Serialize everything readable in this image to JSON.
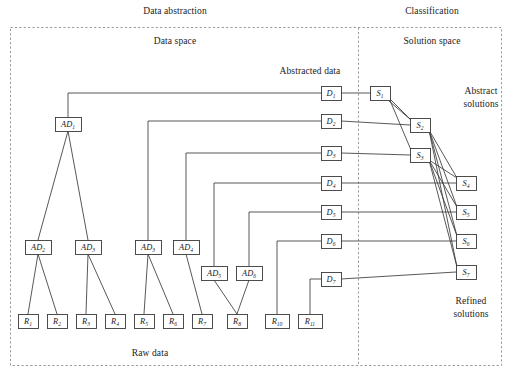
{
  "figure": {
    "headers": {
      "left": "Data abstraction",
      "right": "Classification"
    },
    "regions": {
      "data_space": "Data space",
      "solution_space": "Solution space"
    },
    "annotations": {
      "abstracted_data": "Abstracted data",
      "raw_data": "Raw data",
      "abstract_solutions_line1": "Abstract",
      "abstract_solutions_line2": "solutions",
      "refined_solutions_line1": "Refined",
      "refined_solutions_line2": "solutions"
    },
    "colors": {
      "stroke": "#3a3a3a",
      "box_fill": "#ffffff",
      "text": "#1a1a1a",
      "dashed": "#999999"
    },
    "nodes": {
      "abstracted_data": [
        {
          "id": "AD1",
          "base": "AD",
          "sub": "1",
          "x": 68,
          "y": 124
        },
        {
          "id": "AD2",
          "base": "AD",
          "sub": "2",
          "x": 38,
          "y": 247
        },
        {
          "id": "AD3a",
          "base": "AD",
          "sub": "3",
          "x": 88,
          "y": 247
        },
        {
          "id": "AD3b",
          "base": "AD",
          "sub": "3",
          "x": 148,
          "y": 247
        },
        {
          "id": "AD4",
          "base": "AD",
          "sub": "4",
          "x": 186,
          "y": 247
        },
        {
          "id": "AD5",
          "base": "AD",
          "sub": "5",
          "x": 214,
          "y": 273
        },
        {
          "id": "AD6",
          "base": "AD",
          "sub": "6",
          "x": 249,
          "y": 273
        }
      ],
      "raw_data": [
        {
          "id": "R1",
          "base": "R",
          "sub": "1",
          "x": 28,
          "y": 321
        },
        {
          "id": "R2",
          "base": "R",
          "sub": "2",
          "x": 57,
          "y": 321
        },
        {
          "id": "R3",
          "base": "R",
          "sub": "3",
          "x": 86,
          "y": 321
        },
        {
          "id": "R4",
          "base": "R",
          "sub": "4",
          "x": 115,
          "y": 321
        },
        {
          "id": "R5",
          "base": "R",
          "sub": "5",
          "x": 144,
          "y": 321
        },
        {
          "id": "R6",
          "base": "R",
          "sub": "6",
          "x": 173,
          "y": 321
        },
        {
          "id": "R7",
          "base": "R",
          "sub": "7",
          "x": 202,
          "y": 321
        },
        {
          "id": "R8",
          "base": "R",
          "sub": "8",
          "x": 237,
          "y": 321
        },
        {
          "id": "R10",
          "base": "R",
          "sub": "10",
          "x": 277,
          "y": 321
        },
        {
          "id": "R11",
          "base": "R",
          "sub": "11",
          "x": 310,
          "y": 321
        }
      ],
      "data_abstraction_outputs": [
        {
          "id": "D1",
          "base": "D",
          "sub": "1",
          "x": 331,
          "y": 93
        },
        {
          "id": "D2",
          "base": "D",
          "sub": "2",
          "x": 331,
          "y": 121
        },
        {
          "id": "D3",
          "base": "D",
          "sub": "3",
          "x": 331,
          "y": 153
        },
        {
          "id": "D4",
          "base": "D",
          "sub": "4",
          "x": 331,
          "y": 183
        },
        {
          "id": "D5",
          "base": "D",
          "sub": "5",
          "x": 331,
          "y": 212
        },
        {
          "id": "D6",
          "base": "D",
          "sub": "6",
          "x": 331,
          "y": 241
        },
        {
          "id": "D7",
          "base": "D",
          "sub": "7",
          "x": 331,
          "y": 279
        }
      ],
      "solutions": [
        {
          "id": "S1",
          "base": "S",
          "sub": "1",
          "x": 380,
          "y": 93
        },
        {
          "id": "S2",
          "base": "S",
          "sub": "2",
          "x": 420,
          "y": 125
        },
        {
          "id": "S3",
          "base": "S",
          "sub": "3",
          "x": 420,
          "y": 155
        },
        {
          "id": "S4",
          "base": "S",
          "sub": "4",
          "x": 466,
          "y": 183
        },
        {
          "id": "S5",
          "base": "S",
          "sub": "5",
          "x": 466,
          "y": 212
        },
        {
          "id": "S6",
          "base": "S",
          "sub": "6",
          "x": 466,
          "y": 241
        },
        {
          "id": "S7",
          "base": "S",
          "sub": "7",
          "x": 466,
          "y": 272
        }
      ]
    },
    "edges": {
      "tree": [
        {
          "from": "AD1",
          "to": "AD2"
        },
        {
          "from": "AD1",
          "to": "AD3a"
        },
        {
          "from": "AD2",
          "to": "R1"
        },
        {
          "from": "AD2",
          "to": "R2"
        },
        {
          "from": "AD3a",
          "to": "R3"
        },
        {
          "from": "AD3a",
          "to": "R4"
        },
        {
          "from": "AD3b",
          "to": "R5"
        },
        {
          "from": "AD3b",
          "to": "R6"
        },
        {
          "from": "AD4",
          "to": "R7"
        },
        {
          "from": "AD5",
          "to": "R8"
        },
        {
          "from": "AD6",
          "to": "R8"
        }
      ],
      "to_abstracted_data": [
        {
          "from": "AD1",
          "to": "D1"
        },
        {
          "from": "AD3b",
          "to": "D2"
        },
        {
          "from": "AD4",
          "to": "D3"
        },
        {
          "from": "AD5",
          "to": "D4"
        },
        {
          "from": "AD6",
          "to": "D5"
        },
        {
          "from": "R10",
          "to": "D6"
        },
        {
          "from": "R11",
          "to": "D7"
        }
      ],
      "data_to_solution": [
        {
          "from": "D1",
          "to": "S1"
        },
        {
          "from": "D2",
          "to": "S2"
        },
        {
          "from": "D3",
          "to": "S3"
        },
        {
          "from": "D4",
          "to": "S4"
        },
        {
          "from": "D5",
          "to": "S5"
        },
        {
          "from": "D6",
          "to": "S6"
        },
        {
          "from": "D7",
          "to": "S7"
        }
      ],
      "solution_refinement": [
        {
          "from": "S1",
          "to": "S2"
        },
        {
          "from": "S1",
          "to": "S3"
        },
        {
          "from": "S1",
          "to": "S2b"
        },
        {
          "from": "S2",
          "to": "S4"
        },
        {
          "from": "S2",
          "to": "S5"
        },
        {
          "from": "S2",
          "to": "S6"
        },
        {
          "from": "S2",
          "to": "S7"
        },
        {
          "from": "S3",
          "to": "S4"
        },
        {
          "from": "S3",
          "to": "S5"
        },
        {
          "from": "S3",
          "to": "S6"
        },
        {
          "from": "S3",
          "to": "S7"
        }
      ]
    }
  }
}
